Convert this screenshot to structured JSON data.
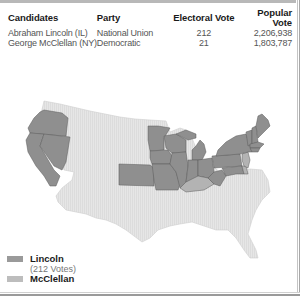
{
  "table": {
    "headers": [
      "Candidates",
      "Party",
      "Electoral Vote",
      "Popular Vote"
    ],
    "rows": [
      {
        "candidate": "Abraham Lincoln (IL)",
        "party": "National Union",
        "electoral_vote": "212",
        "popular_vote": "2,206,938"
      },
      {
        "candidate": "George McClellan (NY)",
        "party": "Democratic",
        "electoral_vote": "21",
        "popular_vote": "1,803,787"
      }
    ]
  },
  "legend": {
    "items": [
      {
        "label": "Lincoln",
        "sublabel": "(212 Votes)",
        "color": "#9a9a9a"
      },
      {
        "label": "McClellan",
        "sublabel": "",
        "color": "#bdbdbd"
      }
    ]
  },
  "map": {
    "colors": {
      "lincoln": "#8f8f8f",
      "mcclellan": "#b3b3b3",
      "non_voting": "#e4e4e4",
      "border": "#5a5a5a"
    },
    "lincoln_states": [
      "CA",
      "OR",
      "NV",
      "KS",
      "MN",
      "IA",
      "MO",
      "WI",
      "IL",
      "MI",
      "IN",
      "OH",
      "WV",
      "PA",
      "MD",
      "NY",
      "VT",
      "NH",
      "ME",
      "MA",
      "RI",
      "CT"
    ],
    "mcclellan_states": [
      "KY",
      "NJ",
      "DE"
    ]
  }
}
